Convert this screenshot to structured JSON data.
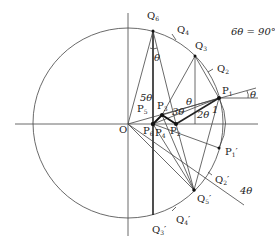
{
  "diagram": {
    "equation": "6θ = 90°",
    "origin_label": "O",
    "points": {
      "Q6": "Q",
      "Q6_sub": "6",
      "Q5": "Q",
      "Q5_sub": "5",
      "Q4": "Q",
      "Q4_sub": "4",
      "Q3": "Q",
      "Q3_sub": "3",
      "Q2": "Q",
      "Q2_sub": "2",
      "P1": "P",
      "P1_sub": "1",
      "P1p": "P",
      "P1p_sub": "1",
      "Q2p": "Q",
      "Q2p_sub": "2",
      "Q3p": "Q",
      "Q3p_sub": "3",
      "Q4p": "Q",
      "Q4p_sub": "4",
      "Q5p": "Q",
      "Q5p_sub": "5",
      "P2": "P",
      "P2_sub": "2",
      "P3": "P",
      "P3_sub": "3",
      "P4": "P",
      "P4_sub": "4",
      "P5": "P",
      "P5_sub": "5",
      "P6": "P",
      "P6_sub": "6"
    },
    "angles": {
      "theta_top": "θ",
      "theta_right": "θ",
      "theta_mid": "θ",
      "five_theta": "5θ",
      "three_theta": "3θ",
      "two_theta": "2θ",
      "four_theta": "4θ",
      "one": "1"
    },
    "prime": "′"
  }
}
